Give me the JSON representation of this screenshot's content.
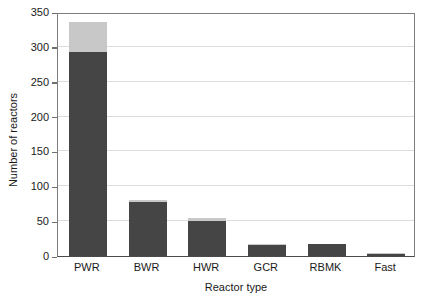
{
  "chart_data": {
    "type": "bar",
    "title": "",
    "xlabel": "Reactor type",
    "ylabel": "Number of reactors",
    "categories": [
      "PWR",
      "BWR",
      "HWR",
      "GCR",
      "RBMK",
      "Fast"
    ],
    "series": [
      {
        "name": "operational",
        "color": "#454545",
        "values": [
          292,
          78,
          50,
          16,
          17,
          3
        ]
      },
      {
        "name": "under-construction",
        "color": "#c8c8c8",
        "values": [
          44,
          3,
          4,
          1,
          0,
          1
        ]
      }
    ],
    "totals": [
      336,
      81,
      54,
      17,
      17,
      4
    ],
    "stacked": true,
    "ylim": [
      0,
      350
    ],
    "yticks": [
      0,
      50,
      100,
      150,
      200,
      250,
      300,
      350
    ],
    "ytick_labels": [
      "0",
      "50",
      "100",
      "150",
      "200",
      "250",
      "300",
      "350"
    ],
    "grid": true,
    "grid_axis": "y",
    "legend": "none",
    "colors": {
      "bar_dark": "#454545",
      "bar_light": "#c8c8c8",
      "gridline": "#dcdcdc",
      "axis": "#4a4a4a",
      "frame": "#7d7d7d",
      "text": "#1a1a1a",
      "background": "#ffffff"
    }
  }
}
